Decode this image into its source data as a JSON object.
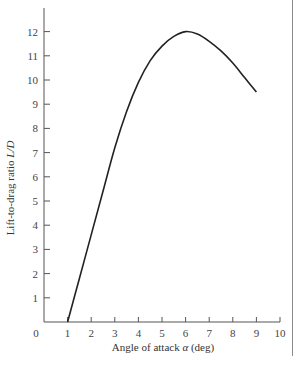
{
  "chart_data": {
    "type": "line",
    "title": "",
    "xlabel": "Angle of attack α (deg)",
    "ylabel": "Lift-to-drag ratio L/D",
    "xlabel_parts": {
      "prefix": "Angle of attack ",
      "symbol": "α",
      "suffix": " (deg)"
    },
    "ylabel_parts": {
      "prefix": "Lift-to-drag ratio ",
      "symbol": "L/D"
    },
    "xlim": [
      0,
      10
    ],
    "ylim": [
      0,
      12.8
    ],
    "x_ticks": [
      0,
      1,
      2,
      3,
      4,
      5,
      6,
      7,
      8,
      9,
      10
    ],
    "y_ticks": [
      1,
      2,
      3,
      4,
      5,
      6,
      7,
      8,
      9,
      10,
      11,
      12
    ],
    "grid": false,
    "legend": null,
    "series": [
      {
        "name": "L/D",
        "x": [
          1.0,
          1.5,
          2.0,
          2.5,
          3.0,
          3.5,
          4.0,
          4.5,
          5.0,
          5.5,
          6.0,
          6.5,
          7.0,
          7.5,
          8.0,
          8.5,
          9.0
        ],
        "y": [
          0.0,
          1.8,
          3.6,
          5.4,
          7.2,
          8.7,
          9.9,
          10.8,
          11.4,
          11.8,
          12.0,
          11.9,
          11.6,
          11.2,
          10.7,
          10.1,
          9.5
        ]
      }
    ]
  }
}
